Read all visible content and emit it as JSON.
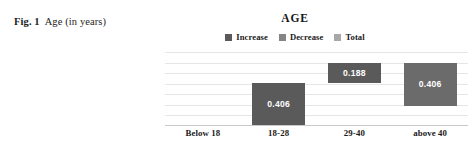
{
  "caption": {
    "label": "Fig. 1",
    "text": "Age (in years)"
  },
  "chart_data": {
    "type": "bar",
    "subtype": "waterfall",
    "title": "AGE",
    "xlabel": "",
    "ylabel": "",
    "categories": [
      "Below 18",
      "18-28",
      "29-40",
      "above 40"
    ],
    "values": [
      0,
      0.406,
      0.188,
      0.406
    ],
    "bar_labels": [
      "",
      "0.406",
      "0.188",
      "0.406"
    ],
    "bar_bases": [
      0,
      0,
      0.406,
      0.188
    ],
    "bar_tops": [
      0,
      0.406,
      0.594,
      0.594
    ],
    "bar_kinds": [
      "increase",
      "increase",
      "increase",
      "total"
    ],
    "ylim": [
      0,
      0.7
    ],
    "grid": true,
    "gridlines": [
      0,
      0.1,
      0.2,
      0.3,
      0.4,
      0.5,
      0.6,
      0.7
    ],
    "legend": {
      "position": "top-center",
      "entries": [
        {
          "label": "Increase",
          "color": "#5a5a5a"
        },
        {
          "label": "Decrease",
          "color": "#858585"
        },
        {
          "label": "Total",
          "color": "#a8a8a8"
        }
      ]
    },
    "colors": {
      "increase": "#5a5a5a",
      "decrease": "#858585",
      "total": "#6b6b6b",
      "gridline": "#e6e6e6",
      "axis": "#c9c9c9",
      "value_text": "#ffffff"
    }
  }
}
